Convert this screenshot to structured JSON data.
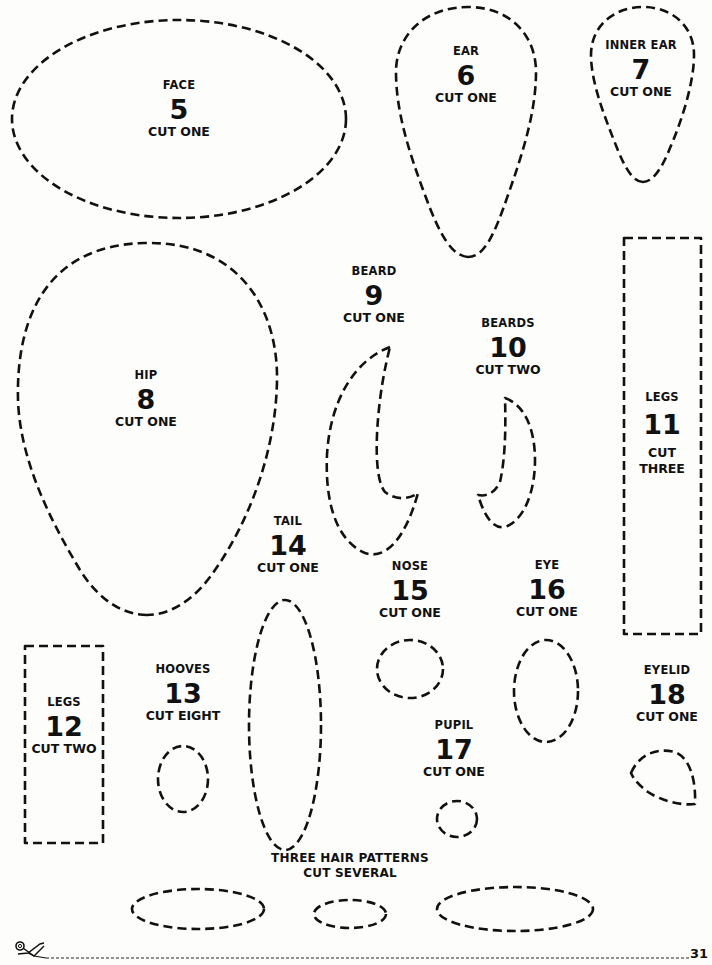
{
  "page": {
    "number": "31"
  },
  "pieces": [
    {
      "id": "face",
      "name": "FACE",
      "number": "5",
      "qty": "CUT ONE",
      "shape": "ellipse"
    },
    {
      "id": "ear",
      "name": "EAR",
      "number": "6",
      "qty": "CUT ONE",
      "shape": "teardrop"
    },
    {
      "id": "inner-ear",
      "name": "INNER EAR",
      "number": "7",
      "qty": "CUT ONE",
      "shape": "teardrop"
    },
    {
      "id": "hip",
      "name": "HIP",
      "number": "8",
      "qty": "CUT ONE",
      "shape": "egg"
    },
    {
      "id": "beard",
      "name": "BEARD",
      "number": "9",
      "qty": "CUT ONE",
      "shape": "crescent"
    },
    {
      "id": "beards",
      "name": "BEARDS",
      "number": "10",
      "qty": "CUT TWO",
      "shape": "crescent"
    },
    {
      "id": "legs-11",
      "name": "LEGS",
      "number": "11",
      "qty_line1": "CUT",
      "qty_line2": "THREE",
      "shape": "rectangle"
    },
    {
      "id": "legs-12",
      "name": "LEGS",
      "number": "12",
      "qty": "CUT TWO",
      "shape": "rectangle"
    },
    {
      "id": "hooves",
      "name": "HOOVES",
      "number": "13",
      "qty": "CUT EIGHT",
      "shape": "ellipse"
    },
    {
      "id": "tail",
      "name": "TAIL",
      "number": "14",
      "qty": "CUT ONE",
      "shape": "ellipse"
    },
    {
      "id": "nose",
      "name": "NOSE",
      "number": "15",
      "qty": "CUT ONE",
      "shape": "ellipse"
    },
    {
      "id": "eye",
      "name": "EYE",
      "number": "16",
      "qty": "CUT ONE",
      "shape": "ellipse"
    },
    {
      "id": "pupil",
      "name": "PUPIL",
      "number": "17",
      "qty": "CUT ONE",
      "shape": "ellipse"
    },
    {
      "id": "eyelid",
      "name": "EYELID",
      "number": "18",
      "qty": "CUT ONE",
      "shape": "teardrop"
    }
  ],
  "hair": {
    "title": "THREE HAIR PATTERNS",
    "qty": "CUT SEVERAL",
    "count": 3
  },
  "footer": {
    "icon": "scissors-icon",
    "line": "dashed-cut-line"
  },
  "colors": {
    "ink": "#111111",
    "paper": "#fdfdfc"
  }
}
